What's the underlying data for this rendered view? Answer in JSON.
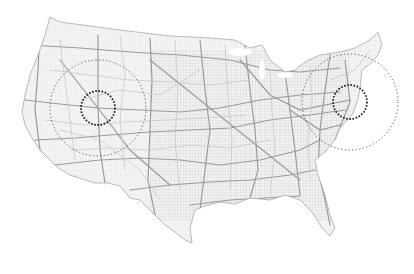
{
  "map": {
    "subject": "Contiguous United States road network",
    "background": "#ffffff",
    "road_color": "#9a9a9a",
    "road_minor_color": "#c8c8c8",
    "circle_color": "#333333",
    "highlights": [
      {
        "name": "west-region",
        "cx": 98,
        "cy": 108,
        "inner_r": 17,
        "outer_r": 48
      },
      {
        "name": "northeast-region",
        "cx": 350,
        "cy": 102,
        "inner_r": 17,
        "outer_r": 48
      }
    ]
  }
}
